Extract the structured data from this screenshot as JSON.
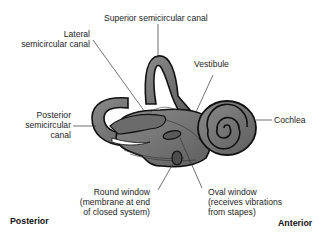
{
  "diagram": {
    "labels": {
      "superior_canal": "Superior semicircular canal",
      "lateral_canal": {
        "line1": "Lateral",
        "line2": "semicircular canal"
      },
      "vestibule": "Vestibule",
      "posterior_canal": {
        "line1": "Posterior",
        "line2": "semicircular",
        "line3": "canal"
      },
      "cochlea": "Cochlea",
      "round_window": {
        "line1": "Round window",
        "line2": "(membrane at end",
        "line3": "of closed system)"
      },
      "oval_window": {
        "line1": "Oval window",
        "line2": "(receives vibrations",
        "line3": "from stapes)"
      }
    },
    "orientation": {
      "left": "Posterior",
      "right": "Anterior"
    },
    "colors": {
      "structure_fill": "#7a7a7a",
      "structure_outline": "#111111",
      "leader_line": "#333333",
      "background": "#ffffff"
    }
  }
}
